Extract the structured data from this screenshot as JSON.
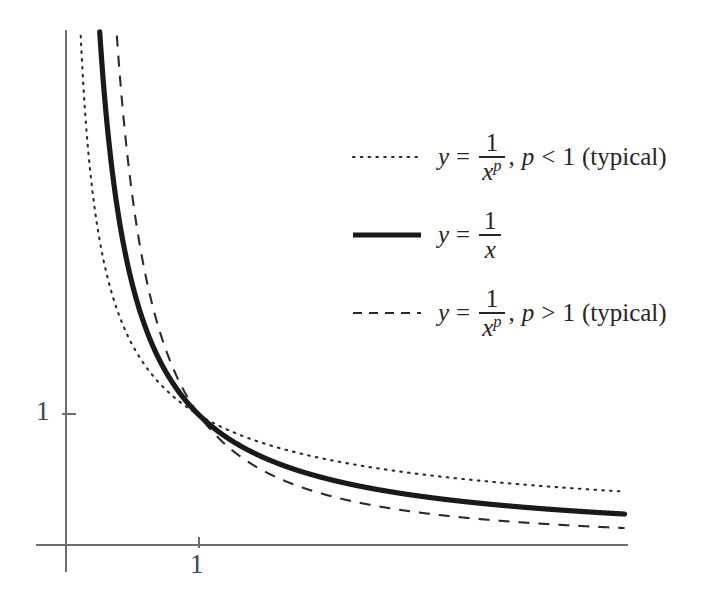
{
  "figure": {
    "background_color": "#ffffff",
    "axis_color": "#6e6e6e",
    "curve_color": "#1a1a1a"
  },
  "axes": {
    "x_tick_labels": [
      "1"
    ],
    "y_tick_labels": [
      "1"
    ],
    "x_label": "",
    "y_label": ""
  },
  "legend": {
    "entries": [
      {
        "style": "dotted",
        "y_var": "y",
        "equals": "=",
        "numerator": "1",
        "denominator": "x",
        "exponent": "p",
        "condition": ", p < 1",
        "condition_p": "p",
        "condition_rel": "<",
        "condition_val": "1",
        "note": "(typical)",
        "text": "y = 1/x^p, p < 1 (typical)"
      },
      {
        "style": "solid",
        "y_var": "y",
        "equals": "=",
        "numerator": "1",
        "denominator": "x",
        "exponent": "",
        "condition": "",
        "condition_p": "",
        "condition_rel": "",
        "condition_val": "",
        "note": "",
        "text": "y = 1/x"
      },
      {
        "style": "dashed",
        "y_var": "y",
        "equals": "=",
        "numerator": "1",
        "denominator": "x",
        "exponent": "p",
        "condition": ", p > 1",
        "condition_p": "p",
        "condition_rel": ">",
        "condition_val": "1",
        "note": "(typical)",
        "text": "y = 1/x^p, p > 1 (typical)"
      }
    ]
  },
  "chart_data": {
    "type": "line",
    "title": "",
    "xlabel": "",
    "ylabel": "",
    "xlim": [
      0,
      4.2
    ],
    "ylim": [
      0,
      3.95
    ],
    "grid": false,
    "legend_position": "upper-right-inside",
    "x_ticks": [
      1
    ],
    "y_ticks": [
      1
    ],
    "x_tick_labels": [
      "1"
    ],
    "y_tick_labels": [
      "1"
    ],
    "common_point": [
      1,
      1
    ],
    "series": [
      {
        "name": "y = 1/x^p, p < 1 (typical)",
        "style": "dotted",
        "p": 0.62,
        "x": [
          0.05,
          0.1,
          0.15,
          0.2,
          0.3,
          0.4,
          0.5,
          0.6,
          0.7,
          0.8,
          0.9,
          1.0,
          1.25,
          1.5,
          1.75,
          2.0,
          2.5,
          3.0,
          3.5,
          4.0,
          4.2
        ],
        "y": [
          7.17,
          4.67,
          3.58,
          3.04,
          2.21,
          1.82,
          1.54,
          1.35,
          1.21,
          1.12,
          1.05,
          1.0,
          0.87,
          0.78,
          0.72,
          0.65,
          0.57,
          0.51,
          0.46,
          0.43,
          0.42
        ]
      },
      {
        "name": "y = 1/x",
        "style": "solid",
        "p": 1.0,
        "x": [
          0.25,
          0.3,
          0.35,
          0.4,
          0.5,
          0.6,
          0.7,
          0.8,
          0.9,
          1.0,
          1.25,
          1.5,
          1.75,
          2.0,
          2.5,
          3.0,
          3.5,
          4.0,
          4.2
        ],
        "y": [
          4.0,
          3.33,
          2.86,
          2.5,
          2.0,
          1.67,
          1.43,
          1.25,
          1.11,
          1.0,
          0.8,
          0.67,
          0.57,
          0.5,
          0.4,
          0.33,
          0.29,
          0.25,
          0.24
        ]
      },
      {
        "name": "y = 1/x^p, p > 1 (typical)",
        "style": "dashed",
        "p": 1.42,
        "x": [
          0.38,
          0.4,
          0.45,
          0.5,
          0.6,
          0.7,
          0.8,
          0.9,
          1.0,
          1.25,
          1.5,
          1.75,
          2.0,
          2.5,
          3.0,
          3.5,
          4.0,
          4.2
        ],
        "y": [
          3.92,
          3.66,
          3.09,
          2.67,
          2.03,
          1.64,
          1.37,
          1.16,
          1.0,
          0.73,
          0.57,
          0.46,
          0.37,
          0.28,
          0.22,
          0.18,
          0.15,
          0.14
        ]
      }
    ]
  }
}
